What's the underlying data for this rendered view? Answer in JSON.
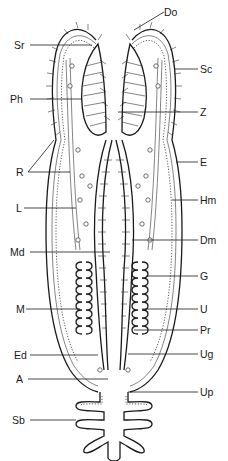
{
  "figure": {
    "type": "anatomical-diagram",
    "labels_left": [
      {
        "id": "sr",
        "text": "Sr"
      },
      {
        "id": "ph",
        "text": "Ph"
      },
      {
        "id": "r",
        "text": "R"
      },
      {
        "id": "l",
        "text": "L"
      },
      {
        "id": "md",
        "text": "Md"
      },
      {
        "id": "m",
        "text": "M"
      },
      {
        "id": "ed",
        "text": "Ed"
      },
      {
        "id": "a",
        "text": "A"
      },
      {
        "id": "sb",
        "text": "Sb"
      }
    ],
    "labels_right": [
      {
        "id": "do",
        "text": "Do"
      },
      {
        "id": "sc",
        "text": "Sc"
      },
      {
        "id": "z",
        "text": "Z"
      },
      {
        "id": "e",
        "text": "E"
      },
      {
        "id": "hm",
        "text": "Hm"
      },
      {
        "id": "dm",
        "text": "Dm"
      },
      {
        "id": "g",
        "text": "G"
      },
      {
        "id": "u",
        "text": "U"
      },
      {
        "id": "pr",
        "text": "Pr"
      },
      {
        "id": "ug",
        "text": "Ug"
      },
      {
        "id": "up",
        "text": "Up"
      }
    ]
  }
}
